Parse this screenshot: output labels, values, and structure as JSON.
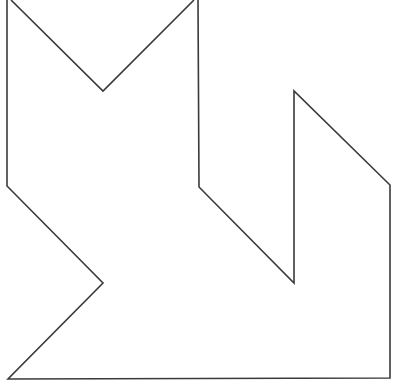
{
  "figure": {
    "type": "tangram-outline",
    "stroke_color": "#3a3a3a",
    "background": "#ffffff",
    "stroke_width": 1.6,
    "outline_points": [
      [
        7,
        0
      ],
      [
        7,
        186
      ],
      [
        103,
        283
      ],
      [
        8,
        379
      ],
      [
        390,
        378
      ],
      [
        390,
        185
      ],
      [
        294,
        91
      ],
      [
        294,
        283
      ],
      [
        199,
        187
      ],
      [
        198,
        0
      ]
    ],
    "notch_points": [
      [
        11,
        0
      ],
      [
        103,
        91
      ],
      [
        194,
        0
      ]
    ]
  }
}
